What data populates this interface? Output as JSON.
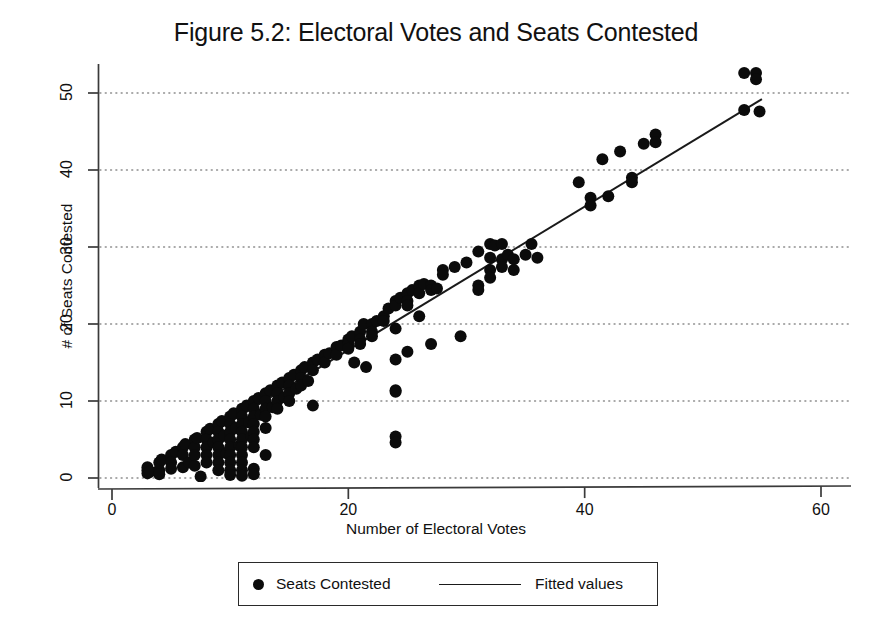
{
  "figure": {
    "title": "Figure 5.2: Electoral Votes and Seats Contested"
  },
  "axes": {
    "x_title": "Number of Electoral Votes",
    "y_title": "# of Seats Contested",
    "x_ticks": [
      "0",
      "20",
      "40",
      "60"
    ],
    "y_ticks": [
      "0",
      "10",
      "20",
      "30",
      "40",
      "50"
    ]
  },
  "legend": {
    "points_label": "Seats Contested",
    "line_label": "Fitted values",
    "point_marker": "filled-circle-icon",
    "line_marker": "solid-line-icon"
  },
  "colors": {
    "ink": "#111111",
    "marker": "#0b0b0b",
    "fit_line": "#1a1a1a",
    "gridline": "#8d8d8d",
    "axis": "#3a3a3a",
    "background": "#ffffff"
  },
  "chart_data": {
    "type": "scatter",
    "title": "Figure 5.2: Electoral Votes and Seats Contested",
    "xlabel": "Number of Electoral Votes",
    "ylabel": "# of Seats Contested",
    "xlim": [
      0,
      60
    ],
    "ylim": [
      0,
      53
    ],
    "xticks": [
      0,
      20,
      40,
      60
    ],
    "yticks": [
      0,
      10,
      20,
      30,
      40,
      50
    ],
    "grid": "horizontal-dotted",
    "legend_position": "below-plot",
    "series": [
      {
        "name": "Seats Contested",
        "type": "scatter",
        "marker": "filled-circle",
        "points": [
          [
            3,
            1
          ],
          [
            3,
            0.6
          ],
          [
            3,
            1.4
          ],
          [
            3.2,
            0.8
          ],
          [
            4,
            1
          ],
          [
            4,
            2
          ],
          [
            4,
            0.5
          ],
          [
            4.2,
            2.4
          ],
          [
            5,
            3
          ],
          [
            5,
            2
          ],
          [
            5,
            1.2
          ],
          [
            5.4,
            3.4
          ],
          [
            6,
            4
          ],
          [
            6,
            3
          ],
          [
            6,
            1.4
          ],
          [
            6.2,
            4.4
          ],
          [
            6.5,
            2
          ],
          [
            7,
            5
          ],
          [
            7,
            4
          ],
          [
            7,
            3
          ],
          [
            7,
            1.6
          ],
          [
            7.2,
            5.2
          ],
          [
            7.5,
            0.2
          ],
          [
            8,
            6
          ],
          [
            8,
            5
          ],
          [
            8,
            4
          ],
          [
            8,
            3
          ],
          [
            8,
            2
          ],
          [
            8.3,
            6.4
          ],
          [
            8.6,
            4.6
          ],
          [
            9,
            7
          ],
          [
            9,
            6
          ],
          [
            9,
            5
          ],
          [
            9,
            4
          ],
          [
            9,
            3
          ],
          [
            9,
            2
          ],
          [
            9,
            1
          ],
          [
            9.3,
            7.4
          ],
          [
            9.5,
            5.5
          ],
          [
            9.7,
            3.2
          ],
          [
            10,
            8
          ],
          [
            10,
            7
          ],
          [
            10,
            6
          ],
          [
            10,
            5
          ],
          [
            10,
            4
          ],
          [
            10,
            3
          ],
          [
            10,
            2
          ],
          [
            10,
            1
          ],
          [
            10,
            0.4
          ],
          [
            10.3,
            8.4
          ],
          [
            10.5,
            6.5
          ],
          [
            10.8,
            4.2
          ],
          [
            11,
            9
          ],
          [
            11,
            8
          ],
          [
            11,
            7
          ],
          [
            11,
            6
          ],
          [
            11,
            5
          ],
          [
            11,
            4
          ],
          [
            11,
            3
          ],
          [
            11,
            2
          ],
          [
            11,
            1
          ],
          [
            11,
            0.3
          ],
          [
            11.4,
            9.4
          ],
          [
            11.6,
            7.2
          ],
          [
            11.8,
            5.4
          ],
          [
            12,
            10
          ],
          [
            12,
            9
          ],
          [
            12,
            8
          ],
          [
            12,
            7
          ],
          [
            12,
            6
          ],
          [
            12,
            5
          ],
          [
            12,
            4
          ],
          [
            12,
            1.2
          ],
          [
            12,
            0.5
          ],
          [
            12.4,
            10.4
          ],
          [
            12.6,
            8.2
          ],
          [
            13,
            11
          ],
          [
            13,
            10
          ],
          [
            13,
            9
          ],
          [
            13,
            8
          ],
          [
            13,
            6.5
          ],
          [
            13,
            3
          ],
          [
            13.4,
            11.4
          ],
          [
            13.6,
            9.2
          ],
          [
            14,
            12
          ],
          [
            14,
            11
          ],
          [
            14,
            10
          ],
          [
            14,
            9
          ],
          [
            14.4,
            12.4
          ],
          [
            14.6,
            10.5
          ],
          [
            15,
            13
          ],
          [
            15,
            12
          ],
          [
            15,
            11
          ],
          [
            15,
            10
          ],
          [
            15.4,
            13.4
          ],
          [
            15.6,
            11.6
          ],
          [
            16,
            14
          ],
          [
            16,
            13
          ],
          [
            16,
            12
          ],
          [
            16.3,
            14.4
          ],
          [
            16.6,
            12.6
          ],
          [
            17,
            15
          ],
          [
            17,
            14
          ],
          [
            17,
            9.4
          ],
          [
            17.4,
            15.4
          ],
          [
            18,
            16
          ],
          [
            18,
            15
          ],
          [
            18.4,
            16.2
          ],
          [
            19,
            17
          ],
          [
            19,
            16
          ],
          [
            19.4,
            17.2
          ],
          [
            20,
            18
          ],
          [
            20,
            17.4
          ],
          [
            20,
            16.8
          ],
          [
            20.3,
            18.4
          ],
          [
            20.5,
            15
          ],
          [
            21,
            19
          ],
          [
            21,
            18
          ],
          [
            21,
            17.4
          ],
          [
            21.3,
            20
          ],
          [
            21.5,
            14.4
          ],
          [
            22,
            20
          ],
          [
            22,
            19
          ],
          [
            22,
            18.4
          ],
          [
            22.4,
            20.4
          ],
          [
            23,
            21
          ],
          [
            23,
            20.4
          ],
          [
            23.4,
            22
          ],
          [
            24,
            23
          ],
          [
            24,
            22.4
          ],
          [
            24,
            19.4
          ],
          [
            24,
            15.4
          ],
          [
            24,
            11.4
          ],
          [
            24,
            11.2
          ],
          [
            24,
            5.4
          ],
          [
            24,
            4.6
          ],
          [
            24.4,
            23.4
          ],
          [
            25,
            24
          ],
          [
            25,
            23
          ],
          [
            25,
            22.4
          ],
          [
            25,
            16.4
          ],
          [
            25.4,
            24.4
          ],
          [
            26,
            25
          ],
          [
            26,
            24
          ],
          [
            26,
            21
          ],
          [
            26.4,
            25.2
          ],
          [
            27,
            25
          ],
          [
            27,
            24.4
          ],
          [
            27,
            17.4
          ],
          [
            27.5,
            24.6
          ],
          [
            28,
            27
          ],
          [
            28,
            26.4
          ],
          [
            29,
            27.4
          ],
          [
            29.5,
            18.4
          ],
          [
            30,
            28
          ],
          [
            31,
            29.4
          ],
          [
            31,
            25
          ],
          [
            31,
            24.4
          ],
          [
            32,
            30.4
          ],
          [
            32,
            28.6
          ],
          [
            32,
            27
          ],
          [
            32,
            26
          ],
          [
            32.4,
            30.2
          ],
          [
            33,
            30.4
          ],
          [
            33,
            28.4
          ],
          [
            33,
            27.4
          ],
          [
            33.5,
            29
          ],
          [
            34,
            28.4
          ],
          [
            34,
            27
          ],
          [
            35,
            29
          ],
          [
            35.5,
            30.4
          ],
          [
            36,
            28.6
          ],
          [
            39.5,
            38.4
          ],
          [
            40.5,
            36.4
          ],
          [
            40.5,
            35.4
          ],
          [
            41.5,
            41.4
          ],
          [
            42,
            36.6
          ],
          [
            43,
            42.4
          ],
          [
            44,
            39
          ],
          [
            44,
            38.4
          ],
          [
            45,
            43.4
          ],
          [
            46,
            44.6
          ],
          [
            46,
            43.6
          ],
          [
            53.5,
            52.6
          ],
          [
            54.5,
            52.6
          ],
          [
            54.5,
            51.8
          ],
          [
            53.5,
            47.8
          ],
          [
            54.8,
            47.6
          ]
        ]
      },
      {
        "name": "Fitted values",
        "type": "line",
        "x": [
          3,
          55
        ],
        "y": [
          0.8,
          49.2
        ],
        "slope": 0.931,
        "intercept": -2.0
      }
    ]
  }
}
